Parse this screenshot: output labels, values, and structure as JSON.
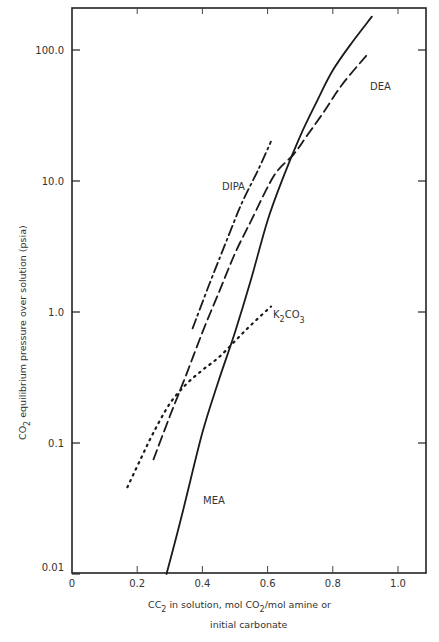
{
  "chart_data": {
    "type": "line",
    "title": "",
    "xlabel": "CO2 in solution, mol CO2/mol amine or initial carbonate",
    "xlabel_lines": [
      "CC₂ in solution, mol CO₂/mol amine or",
      "initial carbonate"
    ],
    "ylabel": "CO2 equilibrium pressure over solution (psia)",
    "yscale": "log",
    "xlim": [
      0,
      1.1
    ],
    "ylim": [
      0.01,
      250
    ],
    "x_ticks": [
      "0",
      "0.2",
      "0.4",
      "0.6",
      "0.8",
      "1.0"
    ],
    "x_tick_values": [
      0,
      0.2,
      0.4,
      0.6,
      0.8,
      1.0
    ],
    "y_ticks": [
      "0.01",
      "0.1",
      "1.0",
      "10.0",
      "100.0"
    ],
    "y_tick_values": [
      0.01,
      0.1,
      1.0,
      10.0,
      100.0
    ],
    "grid": false,
    "legend": "inline labels",
    "series": [
      {
        "name": "MEA",
        "style": "solid",
        "x": [
          0.29,
          0.34,
          0.4,
          0.45,
          0.5,
          0.55,
          0.6,
          0.65,
          0.7,
          0.75,
          0.8,
          0.86,
          0.92
        ],
        "y": [
          0.01,
          0.03,
          0.12,
          0.3,
          0.7,
          1.8,
          5,
          11,
          22,
          40,
          70,
          115,
          180
        ]
      },
      {
        "name": "DEA",
        "style": "dashed",
        "x": [
          0.25,
          0.3,
          0.35,
          0.4,
          0.45,
          0.5,
          0.55,
          0.62,
          0.68,
          0.72,
          0.77,
          0.83,
          0.91
        ],
        "y": [
          0.075,
          0.16,
          0.33,
          0.7,
          1.4,
          2.8,
          5,
          11,
          16,
          22,
          33,
          55,
          95
        ]
      },
      {
        "name": "DIPA",
        "style": "dash-dot",
        "x": [
          0.37,
          0.42,
          0.47,
          0.52,
          0.57,
          0.61
        ],
        "y": [
          0.75,
          1.6,
          3.3,
          6.7,
          12,
          20
        ]
      },
      {
        "name": "K₂CO₃",
        "style": "dotted",
        "x": [
          0.17,
          0.21,
          0.25,
          0.3,
          0.35,
          0.4,
          0.45,
          0.5,
          0.55,
          0.61
        ],
        "y": [
          0.046,
          0.075,
          0.12,
          0.2,
          0.28,
          0.36,
          0.45,
          0.6,
          0.8,
          1.1
        ]
      }
    ],
    "annotations": [
      {
        "text": "MEA",
        "x": 0.47,
        "y": 0.045
      },
      {
        "text": "DEA",
        "x": 0.85,
        "y": 55
      },
      {
        "text": "DIPA",
        "x": 0.37,
        "y": 8
      },
      {
        "text": "K₂CO₃",
        "x": 0.62,
        "y": 1.0
      }
    ]
  },
  "labels": {
    "mea": "MEA",
    "dea": "DEA",
    "dipa": "DIPA",
    "k2co3_main": "K",
    "k2co3_sub1": "2",
    "k2co3_mid": "CO",
    "k2co3_sub2": "3",
    "ylabel_co": "CO",
    "ylabel_sub": "2",
    "ylabel_rest": " equilibrium pressure over solution (psia)",
    "xlabel_line1_a": "CC",
    "xlabel_line1_sub1": "2",
    "xlabel_line1_b": " in solution, mol CO",
    "xlabel_line1_sub2": "2",
    "xlabel_line1_c": "/mol amine or",
    "xlabel_line2": "initial carbonate"
  }
}
